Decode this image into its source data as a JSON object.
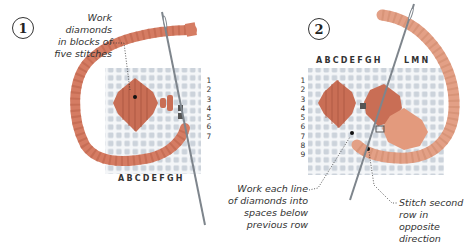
{
  "colors": {
    "yarn": "#d57c63",
    "yarn_dark": "#b95f48",
    "yarn_light": "#e8a186",
    "canvas_bg": "#f3f5f7",
    "canvas_hole": "#c9d0d8",
    "needle": "#8a8f96",
    "text": "#333333"
  },
  "step1": {
    "number": "1",
    "annotation": [
      "Work diamonds",
      "in blocks of",
      "five stitches"
    ],
    "column_labels": "ABCDEFGH",
    "row_labels": [
      "1",
      "2",
      "3",
      "4",
      "5",
      "6",
      "7"
    ]
  },
  "step2": {
    "number": "2",
    "column_labels_left": "ABCDEFGH",
    "column_labels_right": "LMN",
    "row_labels": [
      "1",
      "2",
      "3",
      "4",
      "5",
      "6",
      "7",
      "8",
      "9"
    ],
    "annotation_left": [
      "Work each line",
      "of diamonds into",
      "spaces below",
      "previous row"
    ],
    "annotation_right": [
      "Stitch second",
      "row in opposite",
      "direction"
    ]
  }
}
